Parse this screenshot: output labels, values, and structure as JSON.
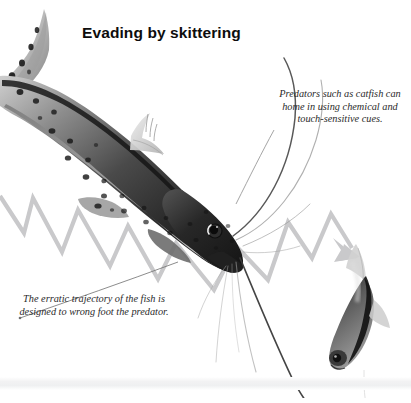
{
  "figure": {
    "title": "Evading by skittering",
    "background_color": "#ffffff",
    "title_color": "#0d0d0d"
  },
  "captions": [
    {
      "id": "predator-caption",
      "text": "Predators such as catfish can home in using chemical and touch-sensitive cues.",
      "position": "right",
      "style": "italic-serif",
      "color": "#2b2b2b"
    },
    {
      "id": "trajectory-caption",
      "text": "The erratic trajectory of the fish is designed to wrong foot the predator.",
      "position": "left",
      "style": "italic-serif",
      "color": "#2b2b2b"
    }
  ],
  "illustration": {
    "arrow": {
      "name": "zigzag-trajectory-arrow",
      "color": "#c9c9cb",
      "direction": "left-to-right, pointing down-right",
      "stroke_width": 4
    },
    "animals": [
      {
        "name": "catfish-predator",
        "description": "large spotted catfish with long barbels diving toward lower right",
        "tone": "grayscale"
      },
      {
        "name": "prey-fish",
        "description": "small dark striped fish skittering downward at right",
        "tone": "grayscale"
      }
    ],
    "leader_lines": [
      {
        "name": "leader-line-predator",
        "color": "#9a9a9a"
      },
      {
        "name": "leader-line-trajectory",
        "color": "#7d7d7d"
      }
    ]
  }
}
